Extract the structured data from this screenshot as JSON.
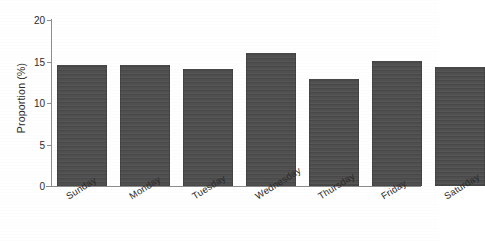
{
  "chart_data": {
    "type": "bar",
    "title": "",
    "xlabel": "",
    "ylabel": "Proportion (%)",
    "categories": [
      "Sunday",
      "Monday",
      "Tuesday",
      "Wednesday",
      "Thursday",
      "Friday",
      "Saturday"
    ],
    "values": [
      14.6,
      14.6,
      14.1,
      16.0,
      12.9,
      15.1,
      14.3
    ],
    "ylim": [
      0,
      20
    ],
    "yticks": [
      0,
      5,
      10,
      15,
      20
    ],
    "ytick_labels": [
      "0",
      "5",
      "10",
      "15",
      "20"
    ],
    "grid": false,
    "legend": null,
    "bar_color": "#4c4c4c",
    "background_color": "#ffffff",
    "axis_color": "#8d8d8d",
    "xtick_rotation_deg": -32
  }
}
